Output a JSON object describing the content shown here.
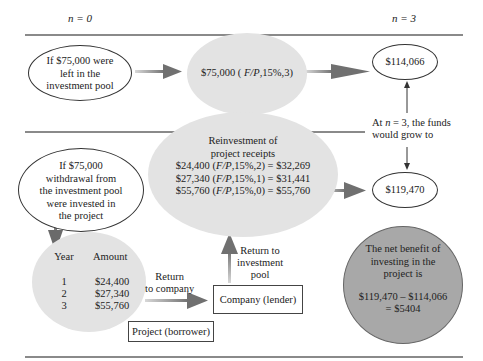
{
  "header": {
    "left_label": "n = 0",
    "right_label": "n = 3"
  },
  "top_row": {
    "left_ellipse": [
      "If $75,000 were",
      "left in the",
      "investment pool"
    ],
    "middle_ellipse": "$75,000 ( F/P,15%,3)",
    "right_ellipse": "$114,066"
  },
  "annotation": [
    "At n = 3, the funds",
    "would grow to"
  ],
  "bottom_row": {
    "left_ellipse": [
      "If $75,000",
      "withdrawal from",
      "the investment pool",
      "were invested in",
      "the project"
    ],
    "reinvestment": {
      "title": [
        "Reinvestment of",
        "project receipts"
      ],
      "lines": [
        "$24,400 (F/P,15%,2) = $32,269",
        "$27,340 (F/P,15%,1) = $31,441",
        "$55,760 (F/P,15%,0) = $55,760"
      ]
    },
    "right_ellipse": "$119,470",
    "cashflow_table": {
      "headers": [
        "Year",
        "Amount"
      ],
      "rows": [
        {
          "year": "1",
          "amount": "$24,400"
        },
        {
          "year": "2",
          "amount": "$27,340"
        },
        {
          "year": "3",
          "amount": "$55,760"
        }
      ]
    },
    "return_to_company": [
      "Return",
      "to company"
    ],
    "return_to_pool": [
      "Return to",
      "investment",
      "pool"
    ],
    "company_box": "Company (lender)",
    "project_box": "Project (borrower)",
    "net_benefit": {
      "text": [
        "The net benefit of",
        "investing in the",
        "project is"
      ],
      "formula": [
        "$119,470 – $114,066",
        "= $5404"
      ]
    }
  },
  "colors": {
    "light_gray_fill": "#e3e3e3",
    "dark_gray_fill": "#a8a8a8",
    "arrow": "#7a7a7a",
    "rule": "#8a8a8a"
  }
}
